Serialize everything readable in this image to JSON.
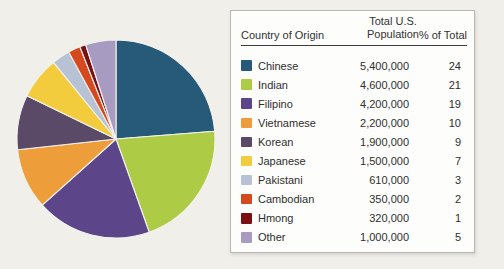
{
  "page": {
    "background_color": "#f0efea",
    "card_background": "#fdfdfb"
  },
  "table": {
    "columns": [
      "Country of Origin",
      "Total U.S. Population",
      "% of Total"
    ]
  },
  "chart_data": {
    "type": "pie",
    "title": "",
    "categories": [
      "Chinese",
      "Indian",
      "Filipino",
      "Vietnamese",
      "Korean",
      "Japanese",
      "Pakistani",
      "Cambodian",
      "Hmong",
      "Other"
    ],
    "values": [
      24,
      21,
      19,
      10,
      9,
      7,
      3,
      2,
      1,
      5
    ],
    "populations": [
      "5,400,000",
      "4,600,000",
      "4,200,000",
      "2,200,000",
      "1,900,000",
      "1,500,000",
      "610,000",
      "350,000",
      "320,000",
      "1,000,000"
    ],
    "colors": [
      "#275a78",
      "#aecb45",
      "#5d4589",
      "#ee9d3b",
      "#5b4a67",
      "#f3cc3e",
      "#b7c3d5",
      "#d6491e",
      "#7b1013",
      "#a89bc2"
    ],
    "value_label": "% of Total",
    "series_label": "Total U.S. Population",
    "start_angle_deg": -90,
    "direction": "clockwise",
    "slice_gap_color": "#f4f3ef",
    "legend_position": "right-table",
    "grid": false
  }
}
